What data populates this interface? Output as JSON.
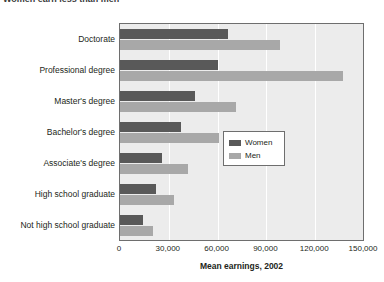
{
  "title": "Women earn less than men",
  "legend": {
    "position": "inside-right-middle",
    "entries": [
      {
        "label": "Women",
        "color": "#595959"
      },
      {
        "label": "Men",
        "color": "#a8a8a8"
      }
    ]
  },
  "axis": {
    "x_title": "Mean earnings, 2002",
    "ticks": [
      "0",
      "30,000",
      "60,000",
      "90,000",
      "120,000",
      "150,000"
    ]
  },
  "chart_data": {
    "type": "bar",
    "orientation": "horizontal",
    "title": "Women earn less than men",
    "xlabel": "Mean earnings, 2002",
    "ylabel": "",
    "xlim": [
      0,
      150000
    ],
    "xticks": [
      0,
      30000,
      60000,
      90000,
      120000,
      150000
    ],
    "xtick_labels": [
      "0",
      "30,000",
      "60,000",
      "90,000",
      "120,000",
      "150,000"
    ],
    "grid": true,
    "grid_axis": "x",
    "legend_entries": [
      "Women",
      "Men"
    ],
    "categories": [
      "Doctorate",
      "Professional degree",
      "Master's degree",
      "Bachelor's degree",
      "Associate's degree",
      "High school graduate",
      "Not high school graduate"
    ],
    "series": [
      {
        "name": "Women",
        "color": "#595959",
        "values": [
          66700,
          60000,
          46000,
          37500,
          26000,
          22000,
          14000
        ]
      },
      {
        "name": "Men",
        "color": "#a8a8a8",
        "values": [
          98600,
          137000,
          71500,
          61000,
          42000,
          33000,
          20000
        ]
      }
    ]
  }
}
